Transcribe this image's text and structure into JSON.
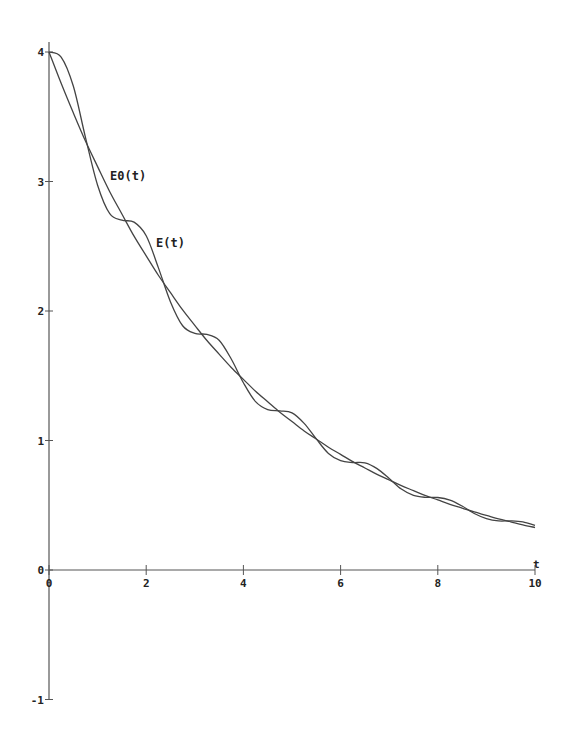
{
  "chart_data": {
    "type": "line",
    "title": "",
    "xlabel": "t",
    "ylabel": "",
    "xlim": [
      0,
      10
    ],
    "ylim": [
      -1,
      4
    ],
    "grid": false,
    "legend": "inline labels",
    "x_ticks": [
      0,
      2,
      4,
      6,
      8,
      10
    ],
    "x_tick_labels": [
      "0",
      "2",
      "4",
      "6",
      "8",
      "10"
    ],
    "y_ticks": [
      -1,
      0,
      1,
      2,
      3,
      4
    ],
    "y_tick_labels": [
      "-1",
      "0",
      "1",
      "2",
      "3",
      "4"
    ],
    "x": [
      0,
      0.25,
      0.5,
      0.75,
      1,
      1.25,
      1.5,
      1.75,
      2,
      2.25,
      2.5,
      2.75,
      3,
      3.25,
      3.5,
      3.75,
      4,
      4.25,
      4.5,
      4.75,
      5,
      5.25,
      5.5,
      5.75,
      6,
      6.25,
      6.5,
      6.75,
      7,
      7.25,
      7.5,
      7.75,
      8,
      8.25,
      8.5,
      8.75,
      9,
      9.25,
      9.5,
      9.75,
      10
    ],
    "series": [
      {
        "name": "E0(t)",
        "values": [
          4.0,
          3.758,
          3.53,
          3.312,
          3.115,
          2.921,
          2.749,
          2.578,
          2.426,
          2.276,
          2.141,
          2.008,
          1.889,
          1.772,
          1.667,
          1.564,
          1.472,
          1.38,
          1.299,
          1.218,
          1.146,
          1.074,
          1.011,
          0.948,
          0.893,
          0.837,
          0.788,
          0.738,
          0.695,
          0.651,
          0.613,
          0.575,
          0.541,
          0.507,
          0.478,
          0.448,
          0.422,
          0.395,
          0.372,
          0.349,
          0.328
        ]
      },
      {
        "name": "E(t)",
        "values": [
          4.0,
          3.961,
          3.737,
          3.341,
          2.971,
          2.751,
          2.701,
          2.686,
          2.581,
          2.335,
          2.07,
          1.886,
          1.827,
          1.819,
          1.774,
          1.629,
          1.446,
          1.3,
          1.239,
          1.229,
          1.213,
          1.132,
          1.012,
          0.9,
          0.844,
          0.83,
          0.827,
          0.783,
          0.707,
          0.625,
          0.576,
          0.561,
          0.56,
          0.54,
          0.494,
          0.436,
          0.397,
          0.379,
          0.379,
          0.371,
          0.344
        ]
      }
    ],
    "annotations": [
      {
        "text": "E0(t)",
        "x": 1.25,
        "y": 3.0
      },
      {
        "text": "E(t)",
        "x": 2.2,
        "y": 2.5
      }
    ]
  },
  "labels": {
    "x_axis": "t",
    "curve_e0": "E0(t)",
    "curve_e": "E(t)"
  },
  "style": {
    "axis_color": "#555555",
    "curve_color": "#444444"
  }
}
